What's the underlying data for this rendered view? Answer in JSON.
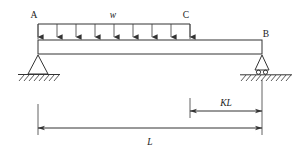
{
  "diagram": {
    "type": "beam-load-diagram",
    "labels": {
      "point_a": "A",
      "point_b": "B",
      "point_c": "C",
      "load": "w",
      "dim_partial": "KL",
      "dim_total": "L"
    },
    "colors": {
      "line": "#333333",
      "text": "#1a1a1a",
      "background": "#ffffff"
    },
    "geometry": {
      "beam_left_x": 38,
      "beam_right_x": 262,
      "beam_top_y": 40,
      "beam_bottom_y": 54,
      "load_start_x": 38,
      "load_end_x": 190,
      "load_bar_y": 24,
      "arrow_count": 9,
      "ground_left_y": 76,
      "ground_right_y": 79,
      "dim_kl_y": 111,
      "dim_l_y": 128,
      "kl_tick_x": 190
    },
    "supports": {
      "left": {
        "kind": "pin",
        "at": "A",
        "x": 38
      },
      "right": {
        "kind": "roller",
        "at": "B",
        "x": 262
      }
    }
  }
}
